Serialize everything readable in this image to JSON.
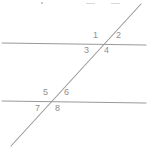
{
  "figure": {
    "background_color": "#ffffff",
    "line_color": "#9a9a9a",
    "label_color": "#8f8f8f",
    "width": 149,
    "height": 148
  },
  "lines": {
    "upper_parallel": {
      "name": "upper-parallel-line",
      "x1": 2,
      "y1": 43,
      "x2": 146,
      "y2": 45
    },
    "lower_parallel": {
      "name": "lower-parallel-line",
      "x1": 2,
      "y1": 101,
      "x2": 146,
      "y2": 103
    },
    "transversal": {
      "name": "transversal-line",
      "x1": 11,
      "y1": 146,
      "x2": 141,
      "y2": 4
    }
  },
  "intersections": {
    "upper": {
      "x": 100,
      "y": 44
    },
    "lower": {
      "x": 52,
      "y": 102
    }
  },
  "angles": [
    {
      "id": "1",
      "label": "1",
      "x": 93,
      "y": 31,
      "position": "upper-left-above"
    },
    {
      "id": "2",
      "label": "2",
      "x": 116,
      "y": 31,
      "position": "upper-right-above"
    },
    {
      "id": "3",
      "label": "3",
      "x": 84,
      "y": 46,
      "position": "upper-left-below"
    },
    {
      "id": "4",
      "label": "4",
      "x": 104,
      "y": 46,
      "position": "upper-right-below"
    },
    {
      "id": "5",
      "label": "5",
      "x": 43,
      "y": 88,
      "position": "lower-left-above"
    },
    {
      "id": "6",
      "label": "6",
      "x": 64,
      "y": 88,
      "position": "lower-right-above"
    },
    {
      "id": "7",
      "label": "7",
      "x": 35,
      "y": 104,
      "position": "lower-left-below"
    },
    {
      "id": "8",
      "label": "8",
      "x": 55,
      "y": 104,
      "position": "lower-right-below"
    }
  ],
  "top_artifacts": [
    {
      "name": "artifact-dot",
      "x": 41,
      "y": 2,
      "width": 2
    },
    {
      "name": "artifact-dash-1",
      "x": 86,
      "y": 3,
      "width": 9
    },
    {
      "name": "artifact-dash-2",
      "x": 111,
      "y": 3,
      "width": 9
    }
  ]
}
